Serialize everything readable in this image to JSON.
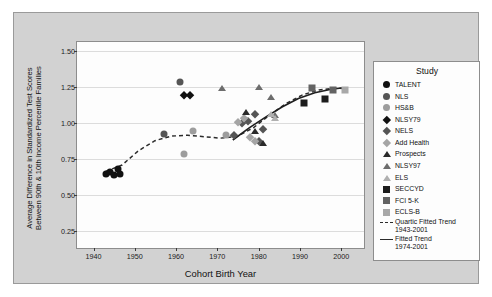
{
  "chart_data": {
    "type": "scatter",
    "title": "",
    "xlabel": "Cohort Birth Year",
    "ylabel": "Average Difference in Standardized Test Scores Between 90th & 10th Income Percentile Families",
    "ylabel_line1": "Average Difference in Standardized Test Scores",
    "ylabel_line2": "Between 90th & 10th Income Percentile Families",
    "xlim": [
      1936,
      2006
    ],
    "ylim": [
      0.12,
      1.56
    ],
    "xticks": [
      1940,
      1950,
      1960,
      1970,
      1980,
      1990,
      2000
    ],
    "yticks": [
      0.25,
      0.5,
      0.75,
      1.0,
      1.25,
      1.5
    ],
    "ytick_labels": [
      "0.25",
      "0.50",
      "0.75",
      "1.00",
      "1.25",
      "1.50"
    ],
    "xtick_labels": [
      "1940",
      "1950",
      "1960",
      "1970",
      "1980",
      "1990",
      "2000"
    ],
    "grid": "horizontal",
    "legend_position": "right",
    "legend_title": "Study",
    "series": [
      {
        "name": "TALENT",
        "marker": "circle",
        "color": "#111111",
        "points": [
          [
            1943,
            0.645
          ],
          [
            1944,
            0.66
          ],
          [
            1945,
            0.638
          ],
          [
            1946,
            0.68
          ],
          [
            1946.5,
            0.648
          ]
        ]
      },
      {
        "name": "NLS",
        "marker": "circle",
        "color": "#555555",
        "points": [
          [
            1957,
            0.925
          ],
          [
            1961,
            1.285
          ]
        ]
      },
      {
        "name": "HS&B",
        "marker": "circle",
        "color": "#9d9d9d",
        "points": [
          [
            1962,
            0.785
          ],
          [
            1964,
            0.945
          ],
          [
            1972,
            0.915
          ]
        ]
      },
      {
        "name": "NLSY79",
        "marker": "diamond",
        "color": "#111111",
        "points": [
          [
            1962,
            1.19
          ],
          [
            1963.4,
            1.19
          ]
        ]
      },
      {
        "name": "NELS",
        "marker": "diamond",
        "color": "#555555",
        "points": [
          [
            1974,
            0.915
          ],
          [
            1976,
            1.0
          ],
          [
            1977.5,
            1.015
          ],
          [
            1979,
            1.06
          ],
          [
            1980,
            0.875
          ],
          [
            1981,
            0.955
          ]
        ]
      },
      {
        "name": "Add Health",
        "marker": "diamond",
        "color": "#a5a5a5",
        "points": [
          [
            1975,
            1.005
          ],
          [
            1976.5,
            1.035
          ],
          [
            1978,
            0.905
          ],
          [
            1979,
            0.875
          ]
        ]
      },
      {
        "name": "Prospects",
        "marker": "triangle",
        "color": "#2a2a2a",
        "points": [
          [
            1977,
            1.075
          ],
          [
            1979,
            0.945
          ],
          [
            1981,
            0.86
          ]
        ]
      },
      {
        "name": "NLSY97",
        "marker": "triangle",
        "color": "#6d6d6d",
        "points": [
          [
            1971,
            1.245
          ],
          [
            1980,
            1.25
          ],
          [
            1983,
            1.18
          ],
          [
            1984,
            1.055
          ]
        ]
      },
      {
        "name": "ELS",
        "marker": "triangle",
        "color": "#b0b0b0",
        "points": [
          [
            1983,
            1.06
          ],
          [
            1984,
            1.035
          ]
        ]
      },
      {
        "name": "SECCYD",
        "marker": "square",
        "color": "#1c1c1c",
        "points": [
          [
            1991,
            1.135
          ],
          [
            1996,
            1.165
          ]
        ]
      },
      {
        "name": "FCI 5-K",
        "marker": "square",
        "color": "#636363",
        "points": [
          [
            1993,
            1.245
          ],
          [
            1998,
            1.225
          ]
        ]
      },
      {
        "name": "ECLS-B",
        "marker": "square",
        "color": "#a8a8a8",
        "points": [
          [
            2001,
            1.225
          ]
        ]
      }
    ],
    "trends": [
      {
        "name": "Quartic Fitted Trend 1943-2001",
        "label_line1": "Quartic Fitted Trend",
        "label_line2": "1943-2001",
        "style": "dashed",
        "color": "#2b2b2b",
        "points": [
          [
            1943,
            0.655
          ],
          [
            1947,
            0.7
          ],
          [
            1951,
            0.8
          ],
          [
            1955,
            0.87
          ],
          [
            1959,
            0.902
          ],
          [
            1963,
            0.908
          ],
          [
            1967,
            0.898
          ],
          [
            1971,
            0.888
          ],
          [
            1975,
            0.9
          ],
          [
            1979,
            0.96
          ],
          [
            1983,
            1.05
          ],
          [
            1987,
            1.13
          ],
          [
            1991,
            1.19
          ],
          [
            1995,
            1.225
          ],
          [
            1999,
            1.238
          ],
          [
            2001,
            1.235
          ]
        ]
      },
      {
        "name": "Fitted Trend 1974-2001",
        "label_line1": "Fitted Trend",
        "label_line2": "1974-2001",
        "style": "solid",
        "color": "#1f1f1f",
        "points": [
          [
            1974,
            0.875
          ],
          [
            1978,
            0.96
          ],
          [
            1982,
            1.035
          ],
          [
            1986,
            1.105
          ],
          [
            1990,
            1.165
          ],
          [
            1994,
            1.205
          ],
          [
            1998,
            1.23
          ],
          [
            2001,
            1.24
          ]
        ]
      }
    ]
  },
  "legend": {
    "title": "Study",
    "items": [
      {
        "label": "TALENT"
      },
      {
        "label": "NLS"
      },
      {
        "label": "HS&B"
      },
      {
        "label": "NLSY79"
      },
      {
        "label": "NELS"
      },
      {
        "label": "Add Health"
      },
      {
        "label": "Prospects"
      },
      {
        "label": "NLSY97"
      },
      {
        "label": "ELS"
      },
      {
        "label": "SECCYD"
      },
      {
        "label": "FCI 5-K"
      },
      {
        "label": "ECLS-B"
      }
    ],
    "trend_items": [
      {
        "line1": "Quartic Fitted Trend",
        "line2": "1943-2001"
      },
      {
        "line1": "Fitted Trend",
        "line2": "1974-2001"
      }
    ]
  },
  "colors": {
    "panel_background": "#d2d2d2",
    "plot_background": "#fdfdfd",
    "grid": "#dcdcdc",
    "axis": "#3a3a3a",
    "text": "#111111"
  }
}
